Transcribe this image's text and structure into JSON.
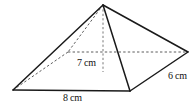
{
  "figure": {
    "name": "square-pyramid",
    "background_color": "#ffffff",
    "solid_edge_color": "#1a1a1a",
    "hidden_edge_color": "#4a4a4a",
    "height_line_color": "#6a6a6a",
    "text_color": "#111111"
  },
  "labels": {
    "height": "7 cm",
    "base_front": "8 cm",
    "base_side": "6 cm"
  },
  "measurements": {
    "height_value": 7,
    "base_length_value": 8,
    "base_width_value": 6,
    "unit": "cm"
  },
  "vertices": {
    "apex": {
      "x": 103,
      "y": 5
    },
    "front_left": {
      "x": 13,
      "y": 90
    },
    "front_right": {
      "x": 130,
      "y": 91
    },
    "back_right": {
      "x": 188,
      "y": 52
    },
    "back_left": {
      "x": 68,
      "y": 52
    },
    "height_foot": {
      "x": 103,
      "y": 72
    }
  },
  "edges": {
    "solid": [
      "apex-front_left",
      "apex-front_right",
      "apex-back_right",
      "front_left-front_right",
      "front_right-back_right"
    ],
    "hidden": [
      "apex-back_left",
      "front_left-back_left",
      "back_left-back_right"
    ],
    "height": "apex-height_foot"
  }
}
